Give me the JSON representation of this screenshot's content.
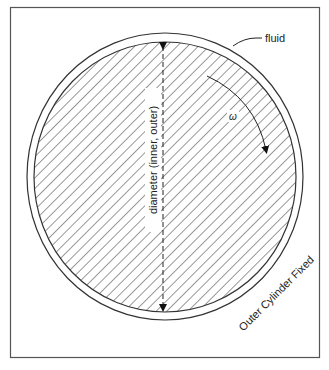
{
  "diagram": {
    "labels": {
      "fluid": "fluid",
      "omega": "ω",
      "diameter": "diameter (inner, outer)",
      "outer_cylinder": "Outer Cylinder Fixed"
    },
    "colors": {
      "stroke": "#333333",
      "frame": "#555555",
      "background": "#ffffff"
    },
    "elements": {
      "inner_cylinder": "rotating inner cylinder (hatched)",
      "outer_cylinder": "fixed outer cylinder",
      "fluid_gap": "fluid annulus",
      "rotation_arrow": "clockwise rotation",
      "diameter_arrow": "vertical double-headed dashed arrow"
    }
  }
}
